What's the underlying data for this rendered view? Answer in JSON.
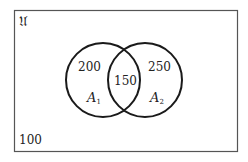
{
  "diagram": {
    "type": "venn",
    "universe_label": "𝔘",
    "outside_value": "100",
    "sets": [
      {
        "name": "A",
        "subscript": "1",
        "only_value": "200"
      },
      {
        "name": "A",
        "subscript": "2",
        "only_value": "250"
      }
    ],
    "intersection_value": "150",
    "stroke_color": "#1a1a1a",
    "border_color": "#555555"
  }
}
